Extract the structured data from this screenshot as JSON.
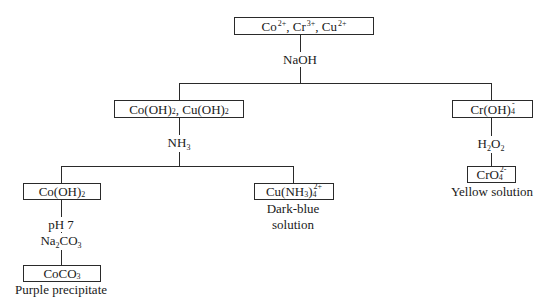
{
  "diagram": {
    "type": "flowchart",
    "title": "",
    "nodes": {
      "root": {
        "parts": [
          [
            "Co",
            "2+",
            ""
          ],
          [
            ", Cr",
            "3+",
            ""
          ],
          [
            ", Cu",
            "2+",
            ""
          ]
        ],
        "text": "Co2+, Cr3+, Cu2+"
      },
      "hydroxides": {
        "text": "Co(OH)2, Cu(OH)2",
        "a": "Co(OH)",
        "a_sub": "2",
        "b": ", Cu(OH)",
        "b_sub": "2"
      },
      "chromite": {
        "text": "Cr(OH)4-",
        "base": "Cr(OH)",
        "sub": "4",
        "sup": "-"
      },
      "cobalt_hydroxide": {
        "text": "Co(OH)2",
        "base": "Co(OH)",
        "sub": "2"
      },
      "copper_ammine": {
        "text": "Cu(NH3)4 2+",
        "a": "Cu(NH",
        "a_sub": "3",
        "b": ")",
        "b_sub": "4",
        "sup": "2+",
        "caption_line1": "Dark-blue",
        "caption_line2": "solution"
      },
      "chromate": {
        "text": "CrO4 2-",
        "base": "CrO",
        "sub": "4",
        "sup": "2-",
        "caption": "Yellow solution"
      },
      "cobalt_carbonate": {
        "text": "CoCO3",
        "base": "CoCO",
        "sub": "3",
        "caption": "Purple precipitate"
      }
    },
    "reagents": {
      "naoh": "NaOH",
      "nh3": {
        "base": "NH",
        "sub": "3"
      },
      "h2o2": {
        "a": "H",
        "a_sub": "2",
        "b": "O",
        "b_sub": "2"
      },
      "ph": "pH 7",
      "na2co3": {
        "a": "Na",
        "a_sub": "2",
        "b": "CO",
        "b_sub": "3"
      }
    },
    "edges": [
      [
        "root",
        "hydroxides",
        "NaOH"
      ],
      [
        "root",
        "chromite",
        "NaOH"
      ],
      [
        "hydroxides",
        "cobalt_hydroxide",
        "NH3"
      ],
      [
        "hydroxides",
        "copper_ammine",
        "NH3"
      ],
      [
        "chromite",
        "chromate",
        "H2O2"
      ],
      [
        "cobalt_hydroxide",
        "cobalt_carbonate",
        "pH 7, Na2CO3"
      ]
    ]
  }
}
